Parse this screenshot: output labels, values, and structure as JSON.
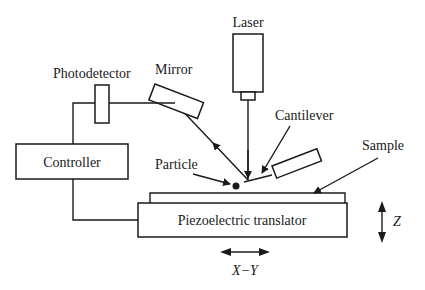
{
  "diagram": {
    "type": "atomic force microscope schematic",
    "labels": {
      "laser": "Laser",
      "photodetector": "Photodetector",
      "mirror": "Mirror",
      "cantilever": "Cantilever",
      "controller": "Controller",
      "particle": "Particle",
      "sample": "Sample",
      "translator": "Piezoelectric translator",
      "z_axis": "Z",
      "xy_axis": "X−Y"
    },
    "colors": {
      "stroke": "#1a1a1a",
      "background": "#ffffff"
    }
  }
}
